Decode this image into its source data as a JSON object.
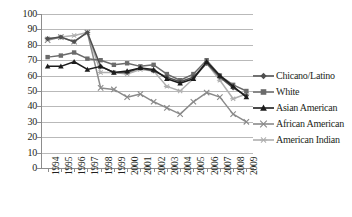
{
  "chart_data": {
    "type": "line",
    "title": "",
    "xlabel": "",
    "ylabel": "",
    "ylim": [
      0,
      100
    ],
    "ytick_step": 10,
    "grid": true,
    "legend_position": "right",
    "categories": [
      "1994",
      "1995",
      "1996",
      "1997",
      "1998",
      "1999",
      "2000",
      "2001",
      "2002",
      "2003",
      "2004",
      "2005",
      "2006",
      "2007",
      "2008",
      "2009"
    ],
    "yticks": [
      "0",
      "10",
      "20",
      "30",
      "40",
      "50",
      "60",
      "70",
      "80",
      "90",
      "100"
    ],
    "series": [
      {
        "name": "Chicano/Latino",
        "marker": "diamond",
        "color": "#4f4f4f",
        "values": [
          84,
          85,
          82,
          88,
          66,
          62,
          62,
          65,
          63,
          59,
          56,
          59,
          68,
          59,
          52,
          47
        ]
      },
      {
        "name": "White",
        "marker": "square",
        "color": "#6b6b6b",
        "values": [
          72,
          73,
          75,
          71,
          70,
          67,
          68,
          66,
          67,
          61,
          57,
          61,
          70,
          60,
          54,
          50
        ]
      },
      {
        "name": "Asian American",
        "marker": "triangle",
        "color": "#1c1c1c",
        "values": [
          66,
          66,
          69,
          64,
          66,
          62,
          63,
          65,
          64,
          58,
          55,
          58,
          69,
          60,
          53,
          46
        ]
      },
      {
        "name": "African American",
        "marker": "cross",
        "color": "#8a8a8a",
        "values": [
          83,
          85,
          82,
          88,
          52,
          51,
          46,
          48,
          43,
          39,
          35,
          43,
          49,
          46,
          35,
          30
        ]
      },
      {
        "name": "American Indian",
        "marker": "asterisk",
        "color": "#b0b0b0",
        "values": [
          84,
          85,
          86,
          88,
          62,
          62,
          61,
          64,
          63,
          53,
          50,
          58,
          68,
          57,
          45,
          48
        ]
      }
    ]
  },
  "legend": {
    "items": [
      {
        "label": "Chicano/Latino"
      },
      {
        "label": "White"
      },
      {
        "label": "Asian American"
      },
      {
        "label": "African American"
      },
      {
        "label": "American Indian"
      }
    ]
  }
}
